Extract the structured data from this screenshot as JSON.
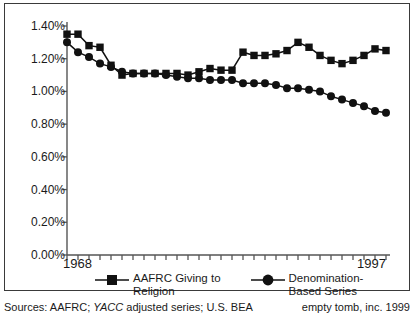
{
  "chart_data": {
    "type": "line",
    "title": "",
    "xlabel": "",
    "ylabel": "",
    "grid": false,
    "legend_position": "bottom",
    "xlim": [
      1968,
      1997
    ],
    "ylim": [
      0.0,
      1.4
    ],
    "x_tick_labels": [
      "1968",
      "1997"
    ],
    "y_tick_labels": [
      "0.00%",
      "0.20%",
      "0.40%",
      "0.60%",
      "0.80%",
      "1.00%",
      "1.20%",
      "1.40%"
    ],
    "y_tick_values": [
      0.0,
      0.2,
      0.4,
      0.6,
      0.8,
      1.0,
      1.2,
      1.4
    ],
    "x": [
      1968,
      1969,
      1970,
      1971,
      1972,
      1973,
      1974,
      1975,
      1976,
      1977,
      1978,
      1979,
      1980,
      1981,
      1982,
      1983,
      1984,
      1985,
      1986,
      1987,
      1988,
      1989,
      1990,
      1991,
      1992,
      1993,
      1994,
      1995,
      1996,
      1997
    ],
    "series": [
      {
        "name": "AAFRC Giving to Religion",
        "marker": "square",
        "color": "#111111",
        "values": [
          1.35,
          1.35,
          1.28,
          1.27,
          1.16,
          1.1,
          1.11,
          1.11,
          1.11,
          1.11,
          1.11,
          1.1,
          1.12,
          1.14,
          1.13,
          1.13,
          1.24,
          1.22,
          1.22,
          1.23,
          1.25,
          1.3,
          1.27,
          1.22,
          1.19,
          1.17,
          1.19,
          1.22,
          1.26,
          1.25
        ]
      },
      {
        "name": "Denomination-Based Series",
        "marker": "circle",
        "color": "#111111",
        "values": [
          1.3,
          1.24,
          1.21,
          1.17,
          1.15,
          1.12,
          1.11,
          1.11,
          1.11,
          1.1,
          1.09,
          1.08,
          1.08,
          1.07,
          1.07,
          1.07,
          1.05,
          1.05,
          1.05,
          1.04,
          1.02,
          1.02,
          1.01,
          1.0,
          0.97,
          0.95,
          0.93,
          0.91,
          0.88,
          0.87
        ]
      }
    ]
  },
  "legend": {
    "entries": [
      {
        "label": "AAFRC Giving to\nReligion",
        "marker": "square"
      },
      {
        "label": "Denomination-\nBased Series",
        "marker": "circle"
      }
    ]
  },
  "footer": {
    "sources_prefix": "Sources: AAFRC; ",
    "sources_italic": "YACC",
    "sources_suffix": " adjusted series; U.S. BEA",
    "credit": "empty tomb, inc. 1999"
  },
  "axis": {
    "x_start_label": "1968",
    "x_end_label": "1997"
  },
  "colors": {
    "series": "#111111",
    "axis": "#555555",
    "frame": "#3a3a3a",
    "background": "#ffffff"
  }
}
